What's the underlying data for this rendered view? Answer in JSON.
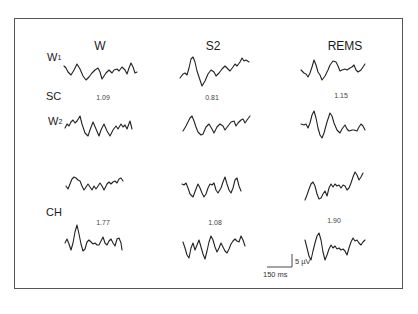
{
  "figure": {
    "columns": [
      {
        "label": "W",
        "x": 100,
        "y": 40
      },
      {
        "label": "S2",
        "x": 213,
        "y": 40
      },
      {
        "label": "REMS",
        "x": 345,
        "y": 40
      }
    ],
    "row_labels": [
      {
        "main": "W",
        "sub": "1",
        "x": 47,
        "y": 52
      },
      {
        "main": "SC",
        "sub": "",
        "x": 46,
        "y": 91
      },
      {
        "main": "W",
        "sub": "2",
        "x": 48,
        "y": 116
      },
      {
        "main": "CH",
        "sub": "",
        "x": 46,
        "y": 207
      }
    ],
    "values": [
      {
        "group": "SC",
        "column": "W",
        "text": "1.09",
        "x": 103,
        "y": 94
      },
      {
        "group": "SC",
        "column": "S2",
        "text": "0.81",
        "x": 212,
        "y": 94
      },
      {
        "group": "SC",
        "column": "REMS",
        "text": "1.15",
        "x": 341,
        "y": 92
      },
      {
        "group": "CH",
        "column": "W",
        "text": "1.77",
        "x": 103,
        "y": 219
      },
      {
        "group": "CH",
        "column": "S2",
        "text": "1.08",
        "x": 215,
        "y": 219
      },
      {
        "group": "CH",
        "column": "REMS",
        "text": "1.90",
        "x": 334,
        "y": 217
      }
    ],
    "scale_bar": {
      "amplitude_label": "5 µV",
      "time_label": "150 ms",
      "h_line": {
        "x1": 267,
        "y1": 267,
        "x2": 292,
        "y2": 267
      },
      "v_line": {
        "x1": 292,
        "y1": 254,
        "x2": 292,
        "y2": 267
      },
      "amp_pos": {
        "x": 295,
        "y": 258
      },
      "time_pos": {
        "x": 263,
        "y": 271
      }
    },
    "traces": [
      {
        "id": "sc-w1-W",
        "points": "64,66 66,68 68,72 71,75 74,70 77,64 80,69 83,76 86,80 89,77 92,73 95,70 98,68 100,72 102,79 104,76 106,73 109,70 112,73 114,70 117,69 119,71 122,67 125,70 127,74 129,68 131,63 133,67 135,73 137,72"
      },
      {
        "id": "sc-w1-S2",
        "points": "180,78 183,74 185,73 187,75 189,68 191,59 193,57 195,62 197,71 200,80 202,86 205,81 208,74 211,70 214,72 216,76 219,73 222,69 225,66 228,69 230,71 233,67 235,64 237,66 240,62 242,58 244,61 246,60 249,62"
      },
      {
        "id": "sc-w1-REMS",
        "points": "301,70 304,73 306,74 308,77 310,73 312,67 314,60 316,65 318,72 320,75 322,80 325,76 328,70 330,65 333,61 336,62 338,66 340,71 342,70 345,69 347,70 350,68 352,67 354,65 356,70 358,72 361,70 363,67 365,64"
      },
      {
        "id": "sc-w2-W",
        "points": "65,128 67,124 69,126 71,122 73,120 75,123 77,121 80,116 82,124 85,133 88,136 90,130 93,122 96,129 99,136 101,130 104,124 107,131 110,136 113,130 116,126 118,129 121,124 123,127 125,125 127,129 130,121 132,129"
      },
      {
        "id": "sc-w2-S2",
        "points": "183,131 186,126 188,122 190,118 192,116 194,121 196,127 198,132 201,135 203,134 206,127 209,124 212,129 214,133 217,127 220,124 223,126 225,130 228,126 231,122 234,121 236,126 238,123 241,120 243,119 245,123 247,120 250,116"
      },
      {
        "id": "sc-w2-REMS",
        "points": "301,124 304,125 306,124 308,128 310,123 312,115 314,111 316,118 318,128 320,135 322,138 324,133 327,122 330,113 332,116 334,123 337,130 340,133 342,129 345,125 347,129 349,131 352,130 354,130 357,131 359,127 361,124 363,126 365,130"
      },
      {
        "id": "ch-w3-W",
        "points": "66,186 68,189 70,184 72,179 74,177 76,178 78,180 80,181 82,186 84,190 86,187 88,184 90,187 92,190 94,186 96,189 98,186 100,183 102,186 104,190 107,184 109,182 111,184 113,182 115,181 117,183 119,179 121,178 123,181"
      },
      {
        "id": "ch-s2-S2",
        "points": "182,184 184,185 186,183 188,188 190,194 193,197 196,189 198,184 200,188 202,193 204,197 206,194 208,188 210,184 212,185 214,183 216,190 218,193 221,188 223,182 225,177 227,184 229,190 231,193 233,188 235,180 237,178 239,186 241,191"
      },
      {
        "id": "ch-w3-REMS",
        "points": "305,200 307,195 309,189 311,184 313,182 315,186 317,194 319,199 321,198 323,194 325,191 327,196 329,188 331,184 333,187 335,184 337,186 339,185 341,188 343,185 345,186 347,190 349,188 351,183 353,177 355,172 357,175 359,180 361,177 363,173"
      },
      {
        "id": "ch-ch-W",
        "points": "65,243 67,239 69,244 71,250 73,243 75,232 77,225 79,234 81,244 83,251 85,249 87,242 89,240 91,242 93,244 95,243 97,245 99,245 101,241 103,237 105,243 107,245 109,241 111,239 113,243 115,246 117,239 119,238 121,243 122,250"
      },
      {
        "id": "ch-ch-S2",
        "points": "183,242 185,248 187,255 189,258 191,248 193,243 195,250 197,245 199,240 201,247 203,254 205,259 207,251 209,242 211,236 213,240 215,247 217,252 219,248 221,243 223,247 225,251 227,253 229,249 231,244 233,241 235,239 237,241 239,242 241,236 243,240 245,246"
      },
      {
        "id": "ch-ch-REMS",
        "points": "305,240 307,248 309,256 311,260 313,251 315,243 317,236 319,233 321,240 323,252 325,260 327,255 329,249 331,245 333,248 335,246 337,249 339,248 341,250 343,249 345,251 347,255 349,248 351,242 353,238 355,241 357,240 359,243 361,245 363,242 365,240"
      }
    ]
  }
}
